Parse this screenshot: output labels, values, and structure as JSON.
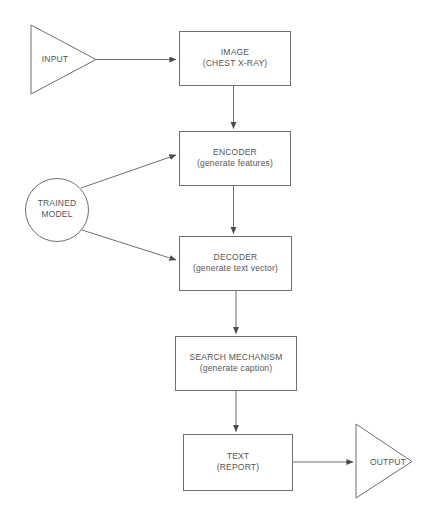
{
  "diagram": {
    "background_color": "#ffffff",
    "stroke_color": "#666666",
    "text_color": "#555555",
    "nodes": [
      {
        "id": "input",
        "shape": "triangle-right",
        "name": "input-terminator",
        "label": "INPUT",
        "sublabel": ""
      },
      {
        "id": "image",
        "shape": "rectangle",
        "name": "image-node",
        "label": "IMAGE",
        "sublabel": "(CHEST X-RAY)"
      },
      {
        "id": "trained_model",
        "shape": "circle",
        "name": "trained-model-node",
        "label": "TRAINED",
        "sublabel": "MODEL"
      },
      {
        "id": "encoder",
        "shape": "rectangle",
        "name": "encoder-node",
        "label": "ENCODER",
        "sublabel": "(generate features)"
      },
      {
        "id": "decoder",
        "shape": "rectangle",
        "name": "decoder-node",
        "label": "DECODER",
        "sublabel": "(generate text vector)"
      },
      {
        "id": "search",
        "shape": "rectangle",
        "name": "search-mechanism-node",
        "label": "SEARCH MECHANISM",
        "sublabel": "(generate caption)"
      },
      {
        "id": "text",
        "shape": "rectangle",
        "name": "text-node",
        "label": "TEXT",
        "sublabel": "(REPORT)"
      },
      {
        "id": "output",
        "shape": "triangle-right",
        "name": "output-terminator",
        "label": "OUTPUT",
        "sublabel": ""
      }
    ],
    "edges": [
      {
        "from": "input",
        "to": "image",
        "name": "edge-input-to-image",
        "direction": "horizontal"
      },
      {
        "from": "image",
        "to": "encoder",
        "name": "edge-image-to-encoder",
        "direction": "vertical"
      },
      {
        "from": "trained_model",
        "to": "encoder",
        "name": "edge-model-to-encoder",
        "direction": "diagonal-up"
      },
      {
        "from": "encoder",
        "to": "decoder",
        "name": "edge-encoder-to-decoder",
        "direction": "vertical"
      },
      {
        "from": "trained_model",
        "to": "decoder",
        "name": "edge-model-to-decoder",
        "direction": "diagonal-down"
      },
      {
        "from": "decoder",
        "to": "search",
        "name": "edge-decoder-to-search",
        "direction": "vertical"
      },
      {
        "from": "search",
        "to": "text",
        "name": "edge-search-to-text",
        "direction": "vertical"
      },
      {
        "from": "text",
        "to": "output",
        "name": "edge-text-to-output",
        "direction": "horizontal"
      }
    ]
  }
}
